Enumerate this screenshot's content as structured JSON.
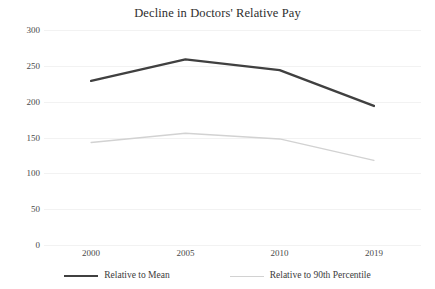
{
  "chart_data": {
    "type": "line",
    "title": "Decline in Doctors' Relative Pay",
    "xlabel": "",
    "ylabel": "",
    "categories": [
      "2000",
      "2005",
      "2010",
      "2019"
    ],
    "x": [
      2000,
      2005,
      2010,
      2019
    ],
    "series": [
      {
        "name": "Relative to Mean",
        "values": [
          229,
          259,
          244,
          194
        ],
        "color": "#404040",
        "line_width": 2.4
      },
      {
        "name": "Relative to 90th Percentile",
        "values": [
          143,
          156,
          148,
          118
        ],
        "color": "#d2d2d2",
        "line_width": 1.4
      }
    ],
    "ylim": [
      0,
      300
    ],
    "ytick_labels": [
      "0",
      "50",
      "100",
      "150",
      "200",
      "250",
      "300"
    ],
    "ytick_values": [
      0,
      50,
      100,
      150,
      200,
      250,
      300
    ],
    "grid": true,
    "grid_color": "#f2f2f2",
    "legend_position": "bottom",
    "markers": false
  },
  "legend": {
    "items": [
      {
        "label": "Relative to Mean",
        "swatch": "dark-line-swatch"
      },
      {
        "label": "Relative to 90th Percentile",
        "swatch": "light-line-swatch"
      }
    ]
  },
  "axis": {
    "y_labels": [
      "300",
      "250",
      "200",
      "150",
      "100",
      "50",
      "0"
    ],
    "x_labels": [
      "2000",
      "2005",
      "2010",
      "2019"
    ]
  }
}
